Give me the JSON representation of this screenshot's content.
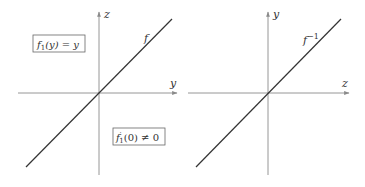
{
  "colors": {
    "background": "#ffffff",
    "axis": "#8a8a8a",
    "curve": "#333333",
    "text": "#333333",
    "box_border": "#666666"
  },
  "left_panel": {
    "vertical_axis_label": "z",
    "horizontal_axis_label": "y",
    "curve_label": "f",
    "box_top": {
      "func": "f",
      "sub": "1",
      "rest": "(y) = y",
      "full": "f₁(y) = y"
    },
    "box_bottom": {
      "func": "f",
      "prime": "′",
      "sub": "1",
      "rest": "(0) ≠ 0",
      "full": "f′₁(0) ≠ 0"
    }
  },
  "right_panel": {
    "vertical_axis_label": "y",
    "horizontal_axis_label": "z",
    "curve_label_base": "f",
    "curve_label_sup": "−1",
    "curve_label_full": "f⁻¹"
  }
}
